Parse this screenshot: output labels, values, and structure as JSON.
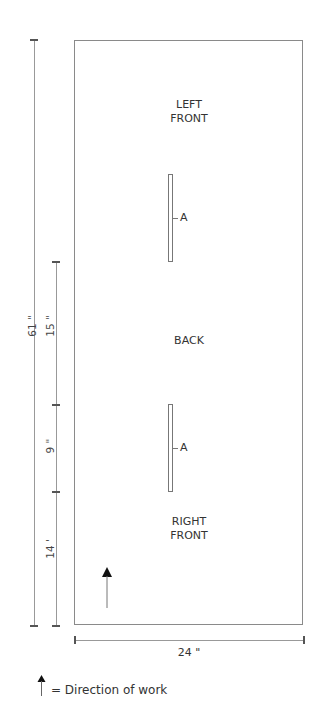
{
  "diagram": {
    "type": "knitting-schematic",
    "panel_labels": {
      "left_front": "LEFT\nFRONT",
      "back": "BACK",
      "right_front": "RIGHT\nFRONT"
    },
    "slit_labels": [
      "A",
      "A"
    ],
    "dimensions": {
      "total_height": "61 \"",
      "segment_top": "15 \"",
      "segment_middle": "9 \"",
      "segment_bottom": "14 '",
      "width": "24 \""
    },
    "legend": {
      "text": "= Direction of work",
      "icon": "arrow-up-icon"
    }
  }
}
